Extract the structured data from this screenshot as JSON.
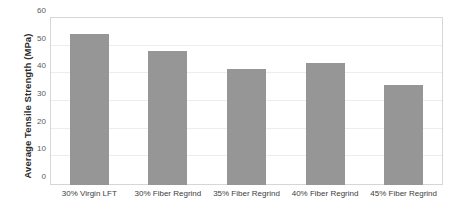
{
  "chart_data": {
    "type": "bar",
    "title": "",
    "xlabel": "",
    "ylabel": "Average Tensile Strength (MPa)",
    "categories": [
      "30% Virgin LFT",
      "30% Fiber Regrind",
      "35% Fiber Regrind",
      "40% Fiber Regrind",
      "45% Fiber Regrind"
    ],
    "values": [
      54.5,
      48.5,
      42,
      44,
      36
    ],
    "ylim": [
      0,
      60
    ],
    "yticks": [
      0,
      10,
      20,
      30,
      40,
      50,
      60
    ],
    "ytick_labels": [
      "0",
      "10",
      "20",
      "30",
      "40",
      "50",
      "60"
    ],
    "grid": "horizontal",
    "legend": "none",
    "bar_color": "#969696",
    "gridline_color": "#ededed",
    "frame_color": "#d6d6d6"
  }
}
